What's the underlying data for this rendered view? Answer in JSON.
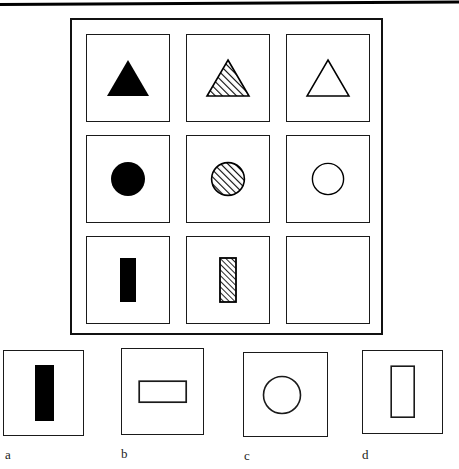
{
  "item": {
    "type": "matrix-reasoning",
    "rows": 3,
    "columns": 3,
    "missing_cell": "row3-col3",
    "top_rule_visible": true
  },
  "colors": {
    "ink": "#000000",
    "line": "#1a1a1a",
    "paper": "#ffffff",
    "fill_solid": "#000000",
    "fill_none": "#ffffff"
  },
  "matrix": {
    "name": "matrix-grid",
    "cells": [
      {
        "id": "r1c1",
        "row": 1,
        "col": 1,
        "shape": "triangle",
        "fill": "solid",
        "label": "solid-triangle"
      },
      {
        "id": "r1c2",
        "row": 1,
        "col": 2,
        "shape": "triangle",
        "fill": "hatched",
        "label": "hatched-triangle"
      },
      {
        "id": "r1c3",
        "row": 1,
        "col": 3,
        "shape": "triangle",
        "fill": "outline",
        "label": "outline-triangle"
      },
      {
        "id": "r2c1",
        "row": 2,
        "col": 1,
        "shape": "circle",
        "fill": "solid",
        "label": "solid-circle"
      },
      {
        "id": "r2c2",
        "row": 2,
        "col": 2,
        "shape": "circle",
        "fill": "hatched",
        "label": "hatched-circle"
      },
      {
        "id": "r2c3",
        "row": 2,
        "col": 3,
        "shape": "circle",
        "fill": "outline",
        "label": "outline-circle"
      },
      {
        "id": "r3c1",
        "row": 3,
        "col": 1,
        "shape": "rectangle-vertical",
        "fill": "solid",
        "label": "solid-vertical-rectangle"
      },
      {
        "id": "r3c2",
        "row": 3,
        "col": 2,
        "shape": "rectangle-vertical",
        "fill": "hatched",
        "label": "hatched-vertical-rectangle"
      },
      {
        "id": "r3c3",
        "row": 3,
        "col": 3,
        "shape": "none",
        "fill": "none",
        "label": "empty-missing-cell"
      }
    ]
  },
  "options": {
    "name": "answer-options",
    "items": [
      {
        "key": "a",
        "letter": "a",
        "shape": "rectangle-vertical",
        "fill": "solid",
        "label": "option-a-solid-vertical-rectangle"
      },
      {
        "key": "b",
        "letter": "b",
        "shape": "rectangle-horizontal",
        "fill": "outline",
        "label": "option-b-outline-horizontal-rectangle"
      },
      {
        "key": "c",
        "letter": "c",
        "shape": "circle",
        "fill": "outline",
        "label": "option-c-outline-circle"
      },
      {
        "key": "d",
        "letter": "d",
        "shape": "rectangle-vertical",
        "fill": "outline",
        "label": "option-d-outline-vertical-rectangle"
      }
    ]
  }
}
